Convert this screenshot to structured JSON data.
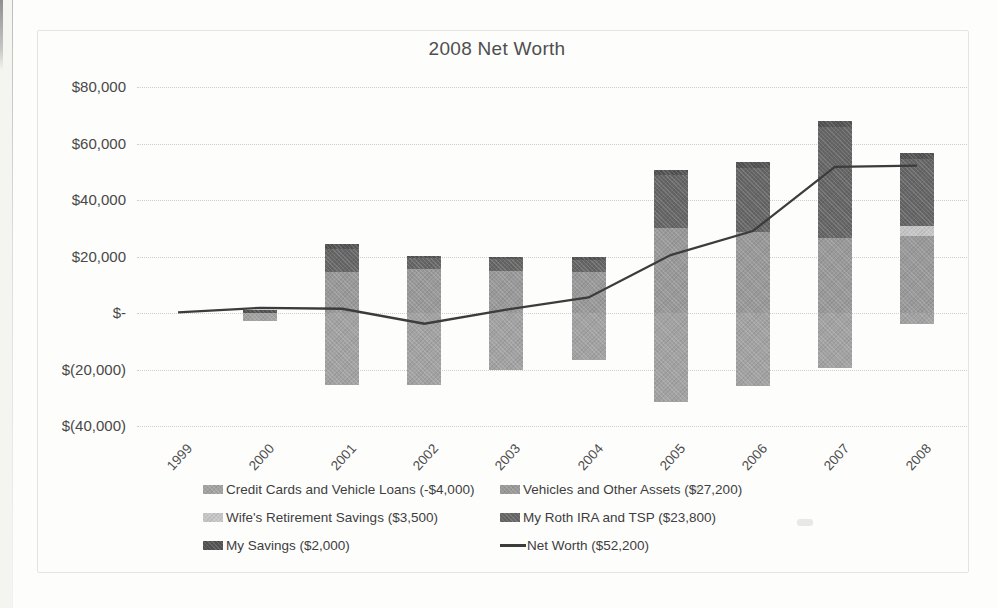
{
  "title": "2008 Net Worth",
  "chart_data": {
    "type": "bar",
    "subtype": "stacked-bar-with-line-combo",
    "title": "2008 Net Worth",
    "categories": [
      "1999",
      "2000",
      "2001",
      "2002",
      "2003",
      "2004",
      "2005",
      "2006",
      "2007",
      "2008"
    ],
    "series": [
      {
        "name": "Credit Cards and Vehicle Loans",
        "legend": "Credit Cards and Vehicle Loans (-$4,000)",
        "color": "#a2a2a2",
        "values": [
          0,
          -2800,
          -25500,
          -25500,
          -20000,
          -16500,
          -31500,
          -26000,
          -19500,
          -4000
        ]
      },
      {
        "name": "Vehicles and Other Assets",
        "legend": "Vehicles and Other Assets ($27,200)",
        "color": "#999999",
        "values": [
          0,
          0,
          14500,
          15500,
          15000,
          14500,
          30000,
          28500,
          26500,
          27200
        ]
      },
      {
        "name": "Wife's Retirement Savings",
        "legend": "Wife's Retirement Savings ($3,500)",
        "color": "#c6c6c6",
        "values": [
          0,
          0,
          0,
          0,
          0,
          0,
          0,
          0,
          0,
          3500
        ]
      },
      {
        "name": "My Roth IRA and TSP",
        "legend": "My Roth IRA and TSP ($23,800)",
        "color": "#666666",
        "values": [
          0,
          0,
          8200,
          4000,
          4200,
          4300,
          19000,
          23000,
          39500,
          23800
        ]
      },
      {
        "name": "My Savings",
        "legend": "My Savings ($2,000)",
        "color": "#535353",
        "values": [
          0,
          1100,
          1800,
          800,
          800,
          900,
          1500,
          2000,
          2000,
          2000
        ]
      }
    ],
    "line_series": {
      "name": "Net Worth",
      "legend": "Net Worth ($52,200)",
      "color": "#3c3c3c",
      "values": [
        200,
        1800,
        1500,
        -3800,
        1200,
        5500,
        20500,
        29000,
        51700,
        52200
      ]
    },
    "y_ticks": [
      {
        "label": "$80,000",
        "value": 80000
      },
      {
        "label": "$60,000",
        "value": 60000
      },
      {
        "label": "$40,000",
        "value": 40000
      },
      {
        "label": "$20,000",
        "value": 20000
      },
      {
        "label": "$-",
        "value": 0
      },
      {
        "label": "$(20,000)",
        "value": -20000
      },
      {
        "label": "$(40,000)",
        "value": -40000
      }
    ],
    "ylim": [
      -40000,
      80000
    ],
    "grid": "horizontal-dotted",
    "legend_position": "bottom-two-columns"
  }
}
